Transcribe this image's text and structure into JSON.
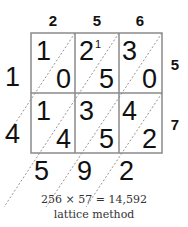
{
  "title": "lattice method",
  "equation": "256 × 57 = 14,592",
  "multiplicand_digits": [
    "2",
    "5",
    "6"
  ],
  "multiplier_digits": [
    "5",
    "7"
  ],
  "cells": [
    [
      {
        "tens": "1",
        "ones": "0",
        "carry": ""
      },
      {
        "tens": "2",
        "ones": "5",
        "carry": "1"
      },
      {
        "tens": "3",
        "ones": "0",
        "carry": ""
      }
    ],
    [
      {
        "tens": "1",
        "ones": "4",
        "carry": ""
      },
      {
        "tens": "3",
        "ones": "5",
        "carry": ""
      },
      {
        "tens": "4",
        "ones": "2",
        "carry": ""
      }
    ]
  ],
  "left_result_digits": [
    "1",
    "4"
  ],
  "bottom_result_digits": [
    "5",
    "9",
    "2"
  ],
  "colors": {
    "grid": "#8a8a8a",
    "diagonal": "#777777",
    "text": "#111111"
  }
}
